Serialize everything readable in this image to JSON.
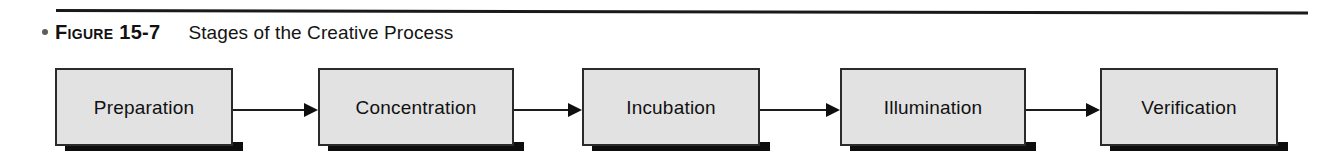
{
  "figure": {
    "bullet": "•",
    "label": "Figure 15-7",
    "title": "Stages of the Creative Process"
  },
  "diagram": {
    "type": "process-flow",
    "orientation": "left-to-right",
    "node_style": {
      "fill": "#e2e2e2",
      "border": "#2b2b2b",
      "shadow": "#0d0d0d"
    },
    "connector_style": {
      "color": "#1c1c1c",
      "arrowhead": "solid-triangle"
    },
    "nodes": [
      {
        "id": "preparation",
        "label": "Preparation",
        "x": 55,
        "width": 178
      },
      {
        "id": "concentration",
        "label": "Concentration",
        "x": 318,
        "width": 196
      },
      {
        "id": "incubation",
        "label": "Incubation",
        "x": 582,
        "width": 178
      },
      {
        "id": "illumination",
        "label": "Illumination",
        "x": 840,
        "width": 186
      },
      {
        "id": "verification",
        "label": "Verification",
        "x": 1100,
        "width": 178
      }
    ],
    "connectors": [
      {
        "id": "preparation-to-concentration",
        "from": "preparation",
        "to": "concentration",
        "x": 233,
        "width": 85
      },
      {
        "id": "concentration-to-incubation",
        "from": "concentration",
        "to": "incubation",
        "x": 514,
        "width": 68
      },
      {
        "id": "incubation-to-illumination",
        "from": "incubation",
        "to": "illumination",
        "x": 760,
        "width": 80
      },
      {
        "id": "illumination-to-verification",
        "from": "illumination",
        "to": "verification",
        "x": 1026,
        "width": 74
      }
    ]
  }
}
